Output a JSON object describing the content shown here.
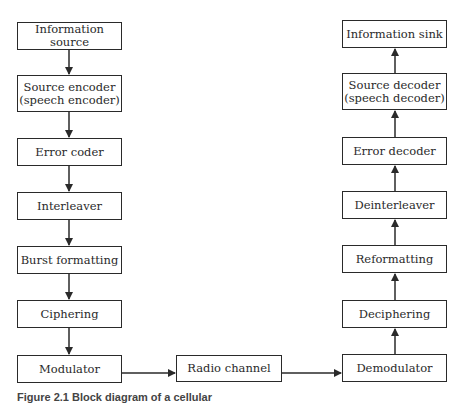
{
  "diagram": {
    "transmitter_chain": [
      {
        "id": "information-source",
        "label": "Information source"
      },
      {
        "id": "source-encoder",
        "label": "Source encoder\n(speech encoder)"
      },
      {
        "id": "error-coder",
        "label": "Error coder"
      },
      {
        "id": "interleaver",
        "label": "Interleaver"
      },
      {
        "id": "burst-formatting",
        "label": "Burst formatting"
      },
      {
        "id": "ciphering",
        "label": "Ciphering"
      },
      {
        "id": "modulator",
        "label": "Modulator"
      }
    ],
    "channel": {
      "id": "radio-channel",
      "label": "Radio channel"
    },
    "receiver_chain": [
      {
        "id": "demodulator",
        "label": "Demodulator"
      },
      {
        "id": "deciphering",
        "label": "Deciphering"
      },
      {
        "id": "reformatting",
        "label": "Reformatting"
      },
      {
        "id": "deinterleaver",
        "label": "Deinterleaver"
      },
      {
        "id": "error-decoder",
        "label": "Error decoder"
      },
      {
        "id": "source-decoder",
        "label": "Source decoder\n(speech decoder)"
      },
      {
        "id": "information-sink",
        "label": "Information sink"
      }
    ],
    "caption": "Figure 2.1  Block diagram of a cellular"
  },
  "colors": {
    "stroke": "#2a2a2a",
    "background": "#ffffff"
  }
}
